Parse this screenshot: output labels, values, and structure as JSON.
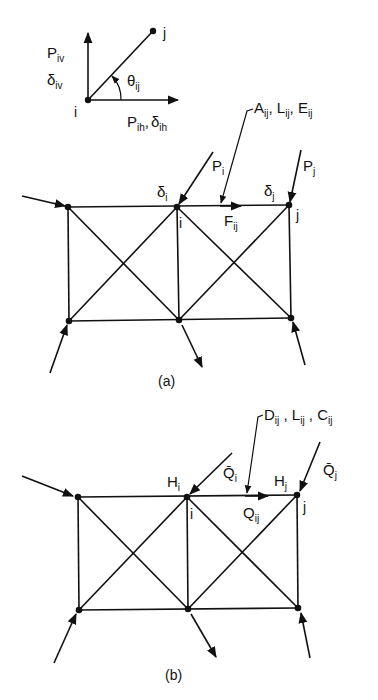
{
  "inset": {
    "vertical_force": "P",
    "vertical_force_sub": "iv",
    "vertical_disp": "δ",
    "vertical_disp_sub": "iv",
    "angle": "θ",
    "angle_sub": "ij",
    "node_i": "i",
    "node_j": "j",
    "horizontal_force": "P",
    "horizontal_force_sub": "ih",
    "horizontal_sep": ",",
    "horizontal_disp": "δ",
    "horizontal_disp_sub": "ih"
  },
  "figure_a": {
    "caption": "(a)",
    "member_props": [
      {
        "sym": "A",
        "sub": "ij"
      },
      {
        "sym": "L",
        "sub": "ij"
      },
      {
        "sym": "E",
        "sub": "ij"
      }
    ],
    "load_i": {
      "sym": "P",
      "sub": "i"
    },
    "load_j": {
      "sym": "P",
      "sub": "j"
    },
    "disp_i": {
      "sym": "δ",
      "sub": "i"
    },
    "disp_j": {
      "sym": "δ",
      "sub": "j"
    },
    "member_force": {
      "sym": "F",
      "sub": "ij"
    },
    "node_i": "i",
    "node_j": "j"
  },
  "figure_b": {
    "caption": "(b)",
    "member_props": [
      {
        "sym": "D",
        "sub": "ij"
      },
      {
        "sym": "L",
        "sub": "ij"
      },
      {
        "sym": "C",
        "sub": "ij"
      }
    ],
    "load_i": {
      "sym": "Q̄",
      "sub": "i"
    },
    "load_j": {
      "sym": "Q̄",
      "sub": "j"
    },
    "head_i": {
      "sym": "H",
      "sub": "i"
    },
    "head_j": {
      "sym": "H",
      "sub": "j"
    },
    "member_flow": {
      "sym": "Q",
      "sub": "ij"
    },
    "node_i": "i",
    "node_j": "j"
  }
}
